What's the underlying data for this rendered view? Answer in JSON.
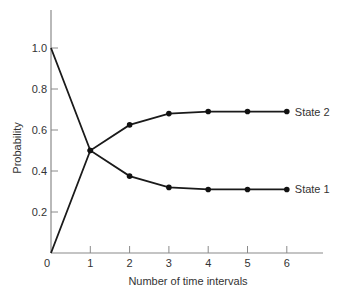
{
  "chart_data": {
    "type": "line",
    "title": "",
    "xlabel": "Number of time intervals",
    "ylabel": "Probability",
    "x": [
      0,
      1,
      2,
      3,
      4,
      5,
      6
    ],
    "x_ticks": [
      "0",
      "1",
      "2",
      "3",
      "4",
      "5",
      "6"
    ],
    "y_ticks": [
      "0.2",
      "0.4",
      "0.6",
      "0.8",
      "1.0"
    ],
    "xlim": [
      0,
      7
    ],
    "ylim": [
      0,
      1.2
    ],
    "grid": false,
    "legend": "inline labels at right end of each series",
    "series": [
      {
        "name": "State 2",
        "values": [
          0.0,
          0.5,
          0.625,
          0.68,
          0.69,
          0.69,
          0.69
        ],
        "markers_from_index": 1
      },
      {
        "name": "State 1",
        "values": [
          1.0,
          0.5,
          0.375,
          0.32,
          0.31,
          0.31,
          0.31
        ],
        "markers_from_index": 1
      }
    ]
  }
}
